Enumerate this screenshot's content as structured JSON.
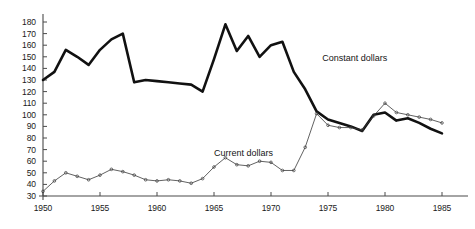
{
  "chart_data": {
    "type": "line",
    "title": "",
    "subtitle": "",
    "xlabel": "",
    "ylabel": "",
    "xlim": [
      1950,
      1985
    ],
    "ylim": [
      30,
      180
    ],
    "grid": false,
    "legend_position": "inline-annotation",
    "x": [
      1950,
      1951,
      1952,
      1953,
      1954,
      1955,
      1956,
      1957,
      1958,
      1959,
      1960,
      1961,
      1962,
      1963,
      1964,
      1965,
      1966,
      1967,
      1968,
      1969,
      1970,
      1971,
      1972,
      1973,
      1974,
      1975,
      1976,
      1977,
      1978,
      1979,
      1980,
      1981,
      1982,
      1983,
      1984,
      1985
    ],
    "xticks": [
      1950,
      1955,
      1960,
      1965,
      1970,
      1975,
      1980,
      1985
    ],
    "xtick_labels": [
      "1950",
      "1955",
      "1960",
      "1965",
      "1970",
      "1975",
      "1980",
      "1985"
    ],
    "yticks": [
      30,
      40,
      50,
      60,
      70,
      80,
      90,
      100,
      110,
      120,
      130,
      140,
      150,
      160,
      170,
      180
    ],
    "ytick_labels": [
      "30",
      "40",
      "50",
      "60",
      "70",
      "80",
      "90",
      "100",
      "110",
      "120",
      "130",
      "140",
      "150",
      "160",
      "170",
      "180"
    ],
    "series": [
      {
        "name": "Constant dollars",
        "style": "thick-solid",
        "color": "#111111",
        "line_width": 2.6,
        "markers": false,
        "label_x": 1974.5,
        "label_y": 148,
        "values": [
          130,
          137,
          156,
          150,
          143,
          156,
          165,
          170,
          128,
          130,
          129,
          128,
          127,
          126,
          120,
          148,
          178,
          155,
          168,
          150,
          160,
          163,
          137,
          122,
          103,
          96,
          93,
          90,
          86,
          100,
          102,
          95,
          97,
          93,
          88,
          84
        ]
      },
      {
        "name": "Current dollars",
        "style": "thin-solid-markers",
        "color": "#3a3a3a",
        "line_width": 0.8,
        "markers": true,
        "label_x": 1965.0,
        "label_y": 66,
        "values": [
          34,
          43,
          50,
          47,
          44,
          48,
          53,
          51,
          48,
          44,
          43,
          44,
          43,
          41,
          45,
          55,
          63,
          57,
          56,
          60,
          59,
          52,
          52,
          72,
          101,
          91,
          89,
          89,
          87,
          99,
          110,
          102,
          100,
          98,
          96,
          93
        ]
      }
    ]
  },
  "axes": {
    "axis_color": "#4a4a4a",
    "tick_color": "#4a4a4a"
  }
}
